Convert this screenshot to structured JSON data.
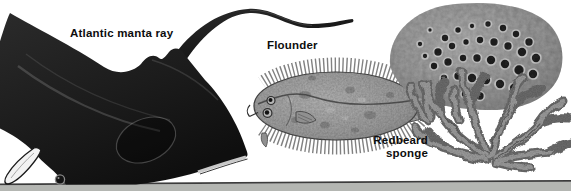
{
  "labels": {
    "manta": "Atlantic manta ray",
    "flounder": "Flounder",
    "sponge_lines": [
      "Redbeard",
      "sponge"
    ]
  },
  "colors": {
    "background": "#ffffff",
    "label_text": "#0d0d0d",
    "manta_body": "#1d1d1d",
    "flounder_body": "#a6a6a6",
    "sponge_body": "#999999",
    "seafloor_band": "#b4b6b2",
    "seafloor_line": "#3c3c3c"
  }
}
